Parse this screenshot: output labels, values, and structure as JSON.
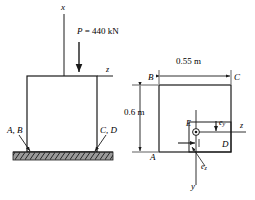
{
  "figure": {
    "line_color": "#1a1a1a",
    "ground_color": "#9a9a9a"
  },
  "elevation": {
    "axis_x_label": "x",
    "axis_z_label": "z",
    "load_label": "P = 440 kN",
    "support_left_label": "A, B",
    "support_right_label": "C, D"
  },
  "section": {
    "width_dim_label": "0.55 m",
    "height_dim_label": "0.6 m",
    "corner_b": "B",
    "corner_c": "C",
    "corner_a": "A",
    "corner_d": "D",
    "point_e": "E",
    "ecc_y_label": "e",
    "ecc_y_sub": "y",
    "ecc_z_label": "e",
    "ecc_z_sub": "z",
    "axis_z_label": "z",
    "axis_y_label": "y"
  }
}
